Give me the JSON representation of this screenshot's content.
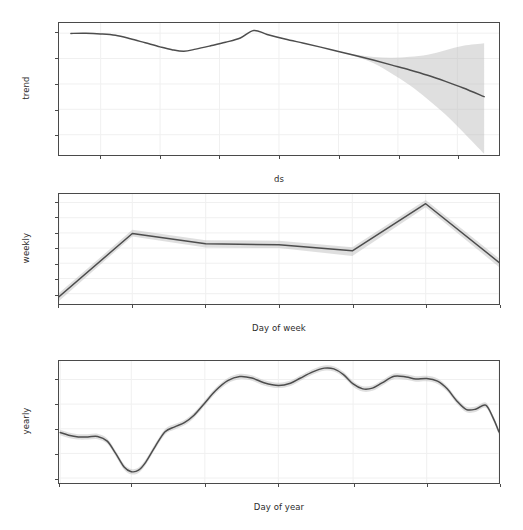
{
  "figure": {
    "name": "prophet-forecast-components",
    "background_color": "#ffffff",
    "line_color": "#4d4d4d",
    "band_color": "#b8b8b8",
    "grid_color": "#f0f0f0",
    "spine_color": "#4a4a4a"
  },
  "chart_data": [
    {
      "type": "line",
      "name": "trend",
      "title": "",
      "xlabel": "ds",
      "ylabel": "trend",
      "xlim": [
        2010.6,
        2025.4
      ],
      "ylim": [
        44,
        148
      ],
      "grid": true,
      "legend": "none",
      "xticks": [
        "2012",
        "2014",
        "2016",
        "2018",
        "2020",
        "2022",
        "2024"
      ],
      "xtick_values": [
        2012,
        2014,
        2016,
        2018,
        2020,
        2022,
        2024
      ],
      "yticks": [
        "60",
        "80",
        "100",
        "120",
        "140"
      ],
      "ytick_values": [
        60,
        80,
        100,
        120,
        140
      ],
      "x": [
        2011.0,
        2011.5,
        2012.0,
        2012.5,
        2013.0,
        2013.5,
        2014.0,
        2014.4,
        2014.8,
        2015.2,
        2015.7,
        2016.2,
        2016.7,
        2017.15,
        2017.6,
        2018.2,
        2018.8,
        2019.4,
        2020.0,
        2020.6,
        2021.2,
        2021.8,
        2022.4,
        2023.0,
        2023.6,
        2024.2,
        2024.9
      ],
      "y": [
        139.8,
        139.9,
        139.4,
        138.3,
        135.6,
        132.4,
        129.2,
        127.0,
        125.8,
        127.4,
        130.0,
        132.8,
        136.2,
        142.1,
        139.0,
        135.4,
        132.2,
        129.0,
        125.6,
        122.2,
        118.6,
        114.8,
        111.0,
        106.8,
        102.0,
        96.8,
        90.0
      ],
      "uncertainty_lower": [
        139.8,
        139.9,
        139.4,
        138.3,
        135.6,
        132.4,
        129.2,
        127.0,
        125.8,
        127.4,
        130.0,
        132.8,
        136.2,
        142.1,
        139.0,
        135.4,
        132.2,
        129.0,
        125.6,
        121.4,
        116.0,
        108.0,
        99.0,
        88.0,
        76.0,
        62.0,
        45.0
      ],
      "uncertainty_upper": [
        139.8,
        139.9,
        139.4,
        138.3,
        135.6,
        132.4,
        129.2,
        127.0,
        125.8,
        127.4,
        130.0,
        132.8,
        136.2,
        142.1,
        139.0,
        135.4,
        132.2,
        129.0,
        125.6,
        123.0,
        121.2,
        120.6,
        121.4,
        123.0,
        126.5,
        130.0,
        132.0
      ]
    },
    {
      "type": "line",
      "name": "weekly",
      "title": "",
      "xlabel": "Day of week",
      "ylabel": "weekly",
      "xlim": [
        0,
        6
      ],
      "ylim": [
        -9.2,
        8.9
      ],
      "grid": true,
      "legend": "none",
      "categories": [
        "Sunday",
        "Monday",
        "Tuesday",
        "Wednesday",
        "Thursday",
        "Friday",
        "Saturday"
      ],
      "yticks": [
        "7.5",
        "5.0",
        "2.5",
        "0.0",
        "-2.5",
        "-5.0",
        "-7.5"
      ],
      "ytick_values": [
        7.5,
        5.0,
        2.5,
        0.0,
        -2.5,
        -5.0,
        -7.5
      ],
      "values": [
        -8.0,
        2.4,
        0.7,
        0.55,
        -0.45,
        7.3,
        -2.35
      ],
      "uncertainty_lower": [
        -8.7,
        1.9,
        0.1,
        0.0,
        -1.3,
        6.7,
        -3.1
      ],
      "uncertainty_upper": [
        -7.4,
        3.0,
        1.3,
        1.2,
        0.15,
        7.9,
        -1.7
      ]
    },
    {
      "type": "line",
      "name": "yearly",
      "title": "",
      "xlabel": "Day of year",
      "ylabel": "yearly",
      "xlim": [
        0,
        365
      ],
      "ylim": [
        -32,
        17.5
      ],
      "grid": true,
      "legend": "none",
      "xticks": [
        "January 1",
        "March 1",
        "May 1",
        "July 1",
        "September 1",
        "November 1",
        "January 1"
      ],
      "xtick_values": [
        1,
        60,
        121,
        182,
        244,
        305,
        365
      ],
      "yticks": [
        "10",
        "0",
        "-10",
        "-20",
        "-30"
      ],
      "ytick_values": [
        10,
        0,
        -10,
        -20,
        -30
      ],
      "x": [
        1,
        8,
        16,
        24,
        32,
        40,
        47,
        54,
        60,
        66,
        72,
        80,
        88,
        96,
        104,
        112,
        121,
        130,
        140,
        150,
        160,
        170,
        182,
        192,
        200,
        210,
        220,
        228,
        236,
        244,
        252,
        260,
        268,
        278,
        288,
        296,
        305,
        314,
        322,
        330,
        338,
        346,
        354,
        360,
        365
      ],
      "y": [
        -11.5,
        -12.6,
        -13.3,
        -13.3,
        -13.1,
        -15.0,
        -20.0,
        -25.5,
        -27.4,
        -26.8,
        -23.5,
        -17.0,
        -11.2,
        -9.2,
        -7.5,
        -4.5,
        0.5,
        5.5,
        9.5,
        11.2,
        10.6,
        8.7,
        7.6,
        8.5,
        10.5,
        13.0,
        14.6,
        14.3,
        12.0,
        8.2,
        6.2,
        6.5,
        8.6,
        11.3,
        11.0,
        10.2,
        10.4,
        9.3,
        6.2,
        1.3,
        -2.2,
        -2.0,
        -0.4,
        -5.5,
        -11.3
      ],
      "uncertainty_band": 1.1
    }
  ],
  "panels": [
    {
      "id": "trend",
      "ylabel": "trend",
      "xlabel": "ds"
    },
    {
      "id": "weekly",
      "ylabel": "weekly",
      "xlabel": "Day of week"
    },
    {
      "id": "yearly",
      "ylabel": "yearly",
      "xlabel": "Day of year"
    }
  ]
}
